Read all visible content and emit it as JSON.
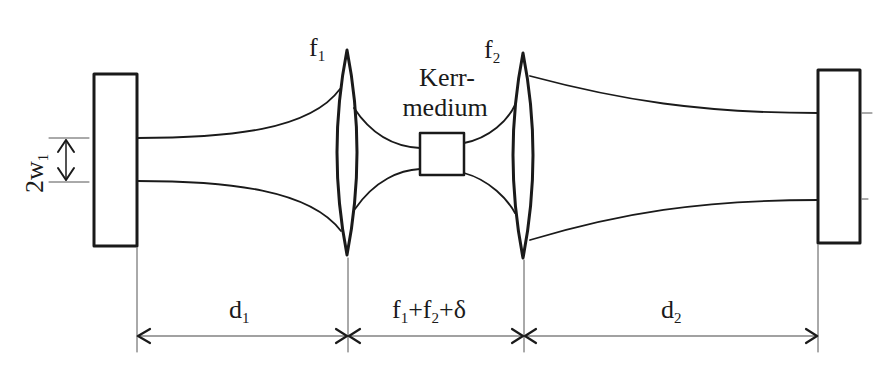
{
  "diagram": {
    "colors": {
      "stroke": "#1a1a1a",
      "background": "#ffffff",
      "guide": "#555555"
    },
    "components": {
      "left_mirror": {
        "label": ""
      },
      "right_mirror": {
        "label": ""
      },
      "lens1": {
        "symbol": "f",
        "sub": "1"
      },
      "lens2": {
        "symbol": "f",
        "sub": "2"
      },
      "kerr_medium": {
        "line1": "Kerr-",
        "line2": "medium"
      }
    },
    "annotations": {
      "beam_waist": {
        "prefix": "2w",
        "sub": "1"
      }
    },
    "dimensions": [
      {
        "id": "d1",
        "symbol": "d",
        "sub": "1"
      },
      {
        "id": "spacing",
        "parts": [
          {
            "t": "f",
            "s": "1"
          },
          {
            "t": "+f",
            "s": "2"
          },
          {
            "t": "+δ",
            "s": ""
          }
        ]
      },
      {
        "id": "d2",
        "symbol": "d",
        "sub": "2"
      }
    ]
  }
}
